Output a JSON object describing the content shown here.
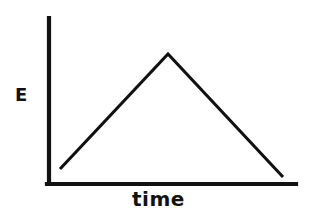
{
  "figure": {
    "name": "energy-vs-time-line-graph",
    "background_color": "#ffffff",
    "ink_color": "#111111"
  },
  "labels": {
    "y_axis": "E",
    "x_axis": "time"
  },
  "axes": {
    "y_axis_name": "y-axis",
    "x_axis_name": "x-axis",
    "y_axis_points": "49,18 49,184",
    "x_axis_points": "47,184 296,184",
    "stroke_width": 4.2
  },
  "chart_data": {
    "type": "line",
    "title": "",
    "subtitle": "",
    "xlabel": "time",
    "ylabel": "E",
    "grid": false,
    "legend": false,
    "legend_position": "none",
    "axis_ticks": [],
    "xlim": [
      0,
      100
    ],
    "ylim": [
      0,
      100
    ],
    "x_tick_labels": [],
    "y_tick_labels": [],
    "series": [
      {
        "name": "energy",
        "x": [
          4.9,
          48.1,
          93.9
        ],
        "y": [
          9.0,
          78.3,
          4.8
        ],
        "points_px": "60,169 168,54 283,177",
        "stroke_width": 3.1,
        "annotation": "Energy rises linearly to a peak then falls linearly"
      }
    ]
  }
}
